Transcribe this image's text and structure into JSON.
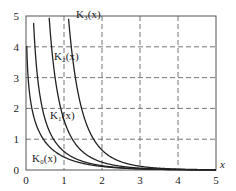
{
  "chart_data": {
    "type": "line",
    "title": "",
    "xlabel": "x",
    "ylabel": "",
    "xlim": [
      0,
      5
    ],
    "ylim": [
      0,
      5
    ],
    "x_ticks": [
      "0",
      "1",
      "2",
      "3",
      "4",
      "5"
    ],
    "y_ticks": [
      "0",
      "1",
      "2",
      "3",
      "4",
      "5"
    ],
    "grid": "dashed",
    "series": [
      {
        "name": "K0(x)",
        "label": "K₀(x)",
        "function": "modified Bessel K0"
      },
      {
        "name": "K1(x)",
        "label": "K₁(x)",
        "function": "modified Bessel K1"
      },
      {
        "name": "K2(x)",
        "label": "K₂(x)",
        "function": "modified Bessel K2"
      },
      {
        "name": "K3(x)",
        "label": "K₃(x)",
        "function": "modified Bessel K3"
      }
    ],
    "annotations": [
      "K₀(x)",
      "K₁(x)",
      "K₂(x)",
      "K₃(x)"
    ]
  },
  "labels": {
    "k0": "K₀(x)",
    "k1": "K₁(x)",
    "k2": "K₂(x)",
    "k3": "K₃(x)",
    "xaxis": "x"
  },
  "ticks": {
    "x": [
      "0",
      "1",
      "2",
      "3",
      "4",
      "5"
    ],
    "y": [
      "0",
      "1",
      "2",
      "3",
      "4",
      "5"
    ]
  }
}
